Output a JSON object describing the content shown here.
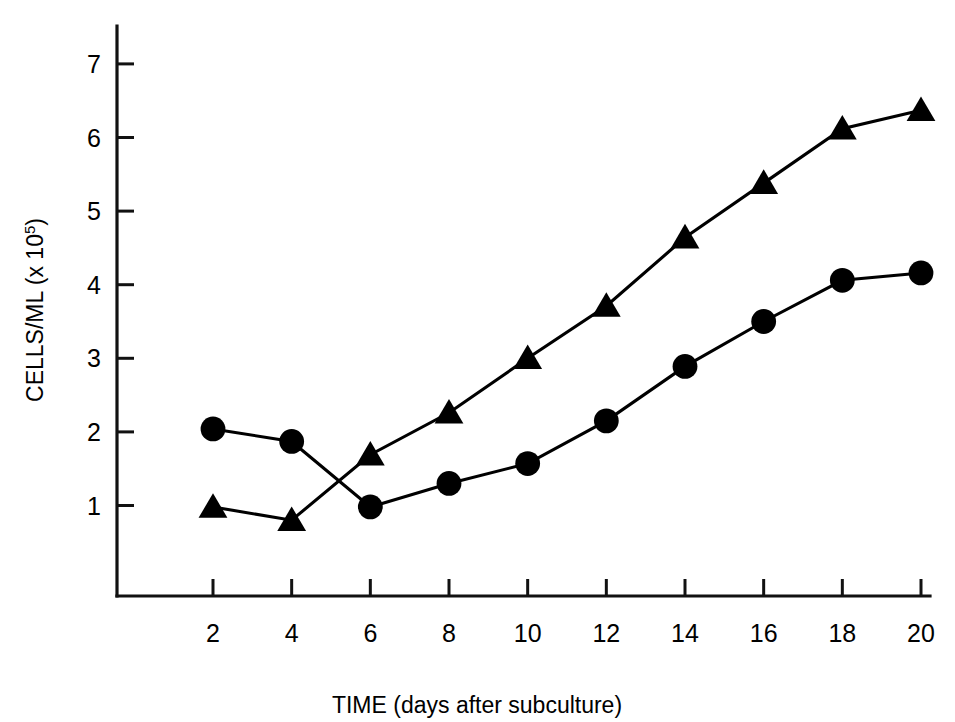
{
  "chart_data": {
    "type": "line",
    "title": "",
    "xlabel": "TIME (days after subculture)",
    "ylabel": "CELLS/ML (x 10⁵)",
    "ylabel_base": "CELLS/ML (x 10",
    "ylabel_exponent": "5",
    "ylabel_close": ")",
    "x": [
      2,
      4,
      6,
      8,
      10,
      12,
      14,
      16,
      18,
      20
    ],
    "xticklabels": [
      "2",
      "4",
      "6",
      "8",
      "10",
      "12",
      "14",
      "16",
      "18",
      "20"
    ],
    "yticks": [
      1,
      2,
      3,
      4,
      5,
      6,
      7
    ],
    "yticklabels": [
      "1",
      "2",
      "3",
      "4",
      "5",
      "6",
      "7"
    ],
    "xlim": [
      0.6,
      20.8
    ],
    "ylim": [
      -0.3,
      7.4
    ],
    "grid": false,
    "legend": "none",
    "series": [
      {
        "name": "circle-series",
        "marker": "circle",
        "color": "#000000",
        "values": [
          2.04,
          1.87,
          0.98,
          1.3,
          1.57,
          2.15,
          2.89,
          3.5,
          4.06,
          4.16
        ]
      },
      {
        "name": "triangle-series",
        "marker": "triangle",
        "color": "#000000",
        "values": [
          0.98,
          0.8,
          1.69,
          2.26,
          3.0,
          3.71,
          4.64,
          5.38,
          6.12,
          6.37
        ]
      }
    ]
  },
  "figure": {
    "background_color": "#ffffff",
    "axis_color": "#111111"
  }
}
